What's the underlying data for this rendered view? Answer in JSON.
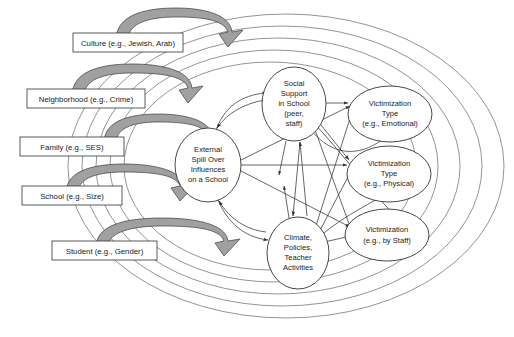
{
  "diagram": {
    "background_color": "#ffffff",
    "line_color": "#555555",
    "band_fill_color": "#a0a0a0",
    "band_stroke_color": "#444444",
    "box_fill_color": "#ffffff",
    "box_stroke_color": "#333333",
    "context_rings": {
      "name": "nested-context-ellipses",
      "count": 5,
      "labels_outside": true
    },
    "context_boxes": [
      {
        "id": "culture",
        "label": "Culture (e.g., Jewish, Arab)"
      },
      {
        "id": "neighborhood",
        "label": "Neighborhood (e.g., Crime)"
      },
      {
        "id": "family",
        "label": "Family (e.g., SES)"
      },
      {
        "id": "school",
        "label": "School (e.g., Size)"
      },
      {
        "id": "student",
        "label": "Student  (e.g., Gender)"
      }
    ],
    "core_nodes": [
      {
        "id": "spillover",
        "lines": [
          "External",
          "Spill Over",
          "Influences",
          "on a School"
        ]
      },
      {
        "id": "social-support",
        "lines": [
          "Social",
          "Support",
          "in School",
          "(peer,",
          "staff)"
        ]
      },
      {
        "id": "climate",
        "lines": [
          "Climate,",
          "Policies,",
          "Teacher",
          "Activities"
        ]
      }
    ],
    "outcome_nodes": [
      {
        "id": "victimization-emotional",
        "lines": [
          "Victimization",
          "Type",
          "(e.g., Emotional)"
        ]
      },
      {
        "id": "victimization-physical",
        "lines": [
          "Victimization",
          "Type",
          "(e.g., Physical)"
        ]
      },
      {
        "id": "victimization-staff",
        "lines": [
          "Victimization",
          "(e.g., by Staff)"
        ]
      }
    ]
  }
}
